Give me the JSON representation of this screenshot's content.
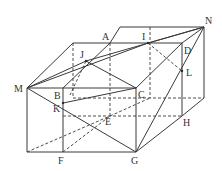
{
  "diagram": {
    "colors": {
      "stroke": "#3a3a3a",
      "label": "#333333",
      "background": "#ffffff"
    },
    "labels": {
      "A": "A",
      "B": "B",
      "C": "C",
      "D": "D",
      "E": "E",
      "F": "F",
      "G": "G",
      "H": "H",
      "I": "I",
      "J": "J",
      "K": "K",
      "L": "L",
      "M": "M",
      "N": "N"
    },
    "points": {
      "M": [
        27,
        88
      ],
      "B": [
        63,
        88
      ],
      "C": [
        136,
        88
      ],
      "D": [
        182,
        43
      ],
      "A": [
        110,
        43
      ],
      "I": [
        148,
        43
      ],
      "J": [
        86,
        61
      ],
      "K": [
        63,
        103
      ],
      "L": [
        182,
        71
      ],
      "E": [
        110,
        116
      ],
      "H": [
        182,
        116
      ],
      "F": [
        63,
        152
      ],
      "G": [
        136,
        152
      ],
      "N": [
        204,
        27
      ]
    }
  }
}
